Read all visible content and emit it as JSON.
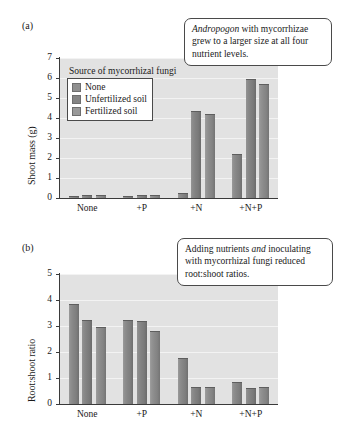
{
  "figure": {
    "panel_a_label": "(a)",
    "panel_b_label": "(b)"
  },
  "legend": {
    "title": "Source of mycorrhizal fungi",
    "items": [
      {
        "label": "None",
        "color": "#8f8f8f"
      },
      {
        "label": "Unfertilized soil",
        "color": "#848484"
      },
      {
        "label": "Fertilized soil",
        "color": "#999999"
      }
    ]
  },
  "callouts": {
    "a": {
      "emphasis": "Andropogon",
      "rest": " with mycorrhizae grew to a larger size at all four nutrient levels."
    },
    "b": {
      "lead": "Adding nutrients ",
      "emphasis": "and",
      "rest": " inoculating with mycorrhizal fungi reduced root:shoot ratios."
    }
  },
  "chart_data": [
    {
      "type": "bar",
      "title": "",
      "xlabel": "",
      "ylabel": "Shoot mass (g)",
      "categories": [
        "None",
        "+P",
        "+N",
        "+N+P"
      ],
      "ylim": [
        0,
        7
      ],
      "yticks": [
        0,
        1,
        2,
        3,
        4,
        5,
        6,
        7
      ],
      "ytick_labels": [
        "0",
        "1",
        "2",
        "3",
        "4",
        "5",
        "6",
        "7"
      ],
      "grid": true,
      "legend_position": "upper-left inside plot",
      "series": [
        {
          "name": "None",
          "values": [
            0.12,
            0.1,
            0.25,
            2.22
          ]
        },
        {
          "name": "Unfertilized soil",
          "values": [
            0.16,
            0.15,
            4.35,
            5.95
          ]
        },
        {
          "name": "Fertilized soil",
          "values": [
            0.15,
            0.16,
            4.18,
            5.72
          ]
        }
      ]
    },
    {
      "type": "bar",
      "title": "",
      "xlabel": "",
      "ylabel": "Root:shoot ratio",
      "categories": [
        "None",
        "+P",
        "+N",
        "+N+P"
      ],
      "ylim": [
        0,
        5
      ],
      "yticks": [
        0,
        1,
        2,
        3,
        4,
        5
      ],
      "ytick_labels": [
        "0",
        "1",
        "2",
        "3",
        "4",
        "5"
      ],
      "grid": true,
      "legend_position": "none",
      "series": [
        {
          "name": "None",
          "values": [
            3.85,
            3.24,
            1.76,
            0.83
          ]
        },
        {
          "name": "Unfertilized soil",
          "values": [
            3.25,
            3.19,
            0.66,
            0.62
          ]
        },
        {
          "name": "Fertilized soil",
          "values": [
            2.95,
            2.81,
            0.64,
            0.66
          ]
        }
      ]
    }
  ]
}
